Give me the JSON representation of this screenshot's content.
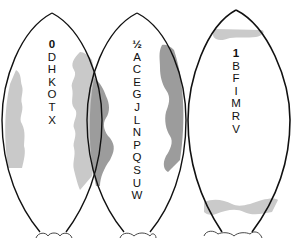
{
  "figure": {
    "colors": {
      "outline": "#111111",
      "light_shade": "#c8c8c8",
      "dark_shade": "#9a9a9a",
      "background": "#ffffff"
    },
    "shapes": [
      {
        "id": "shape-0",
        "header": "0",
        "letters": [
          "D",
          "H",
          "K",
          "O",
          "T",
          "X"
        ],
        "shading": "light gray wavy bands along left and right edges"
      },
      {
        "id": "shape-half",
        "header": "½",
        "letters": [
          "A",
          "C",
          "E",
          "G",
          "J",
          "L",
          "N",
          "P",
          "Q",
          "S",
          "U",
          "W"
        ],
        "shading": "dark gray wavy bands along left and right edges"
      },
      {
        "id": "shape-1",
        "header": "1",
        "letters": [
          "B",
          "F",
          "I",
          "M",
          "R",
          "V"
        ],
        "shading": "light gray horizontal bands near top and bottom"
      }
    ]
  }
}
